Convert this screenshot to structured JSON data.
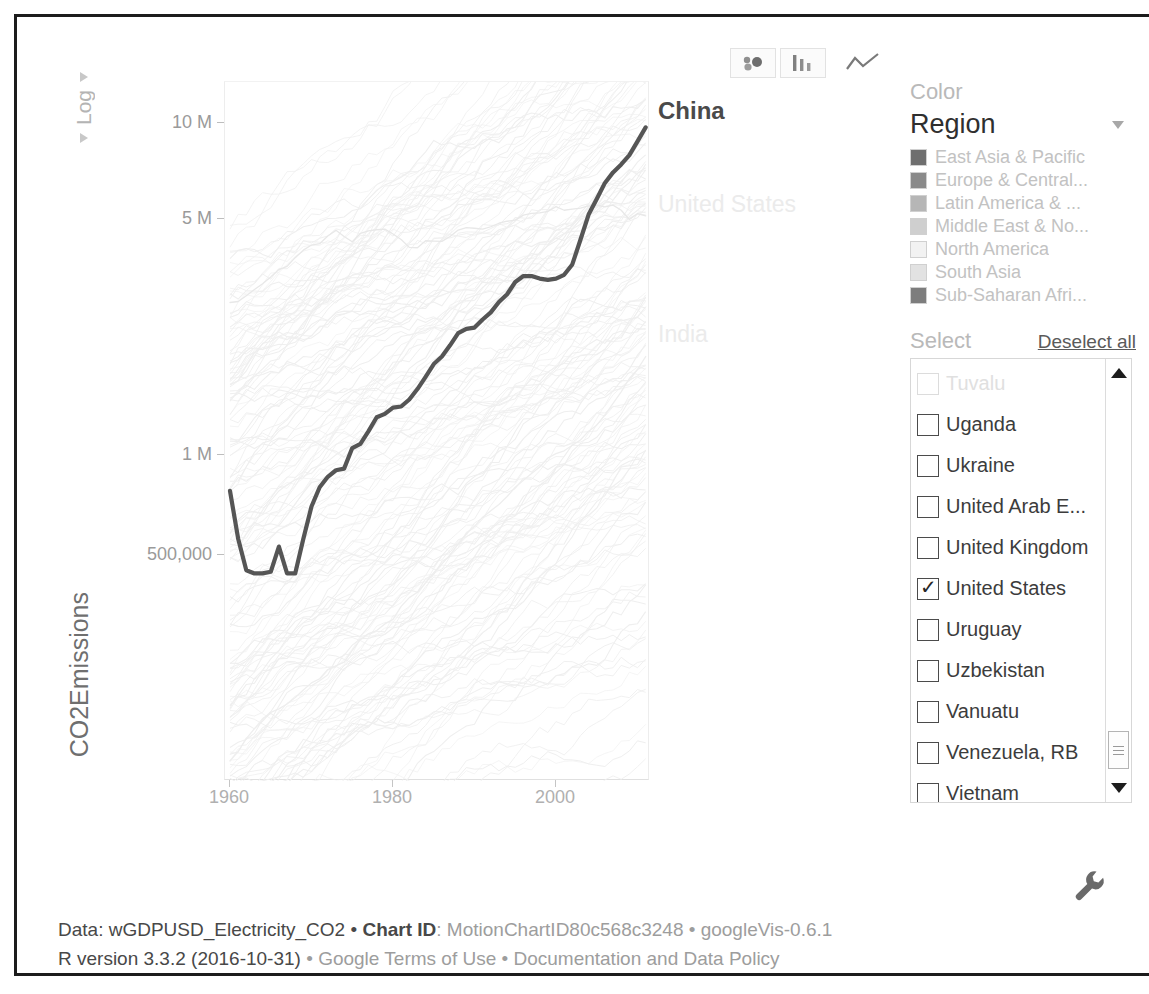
{
  "toolbar": {
    "buttons": [
      {
        "name": "bubble-chart",
        "label": "Bubbles",
        "active": false
      },
      {
        "name": "bar-chart",
        "label": "Bars",
        "active": false
      },
      {
        "name": "line-chart",
        "label": "Lines",
        "active": true
      }
    ]
  },
  "axis_controls": {
    "y_scale_label": "Log"
  },
  "color_panel": {
    "caption": "Color",
    "selected": "Region",
    "legend": [
      {
        "label": "East Asia & Pacific",
        "color": "#6f6f6f"
      },
      {
        "label": "Europe & Central...",
        "color": "#8a8a8a"
      },
      {
        "label": "Latin America & ...",
        "color": "#b6b6b6"
      },
      {
        "label": "Middle East & No...",
        "color": "#cfcfcf"
      },
      {
        "label": "North America",
        "color": "#f2f2f2"
      },
      {
        "label": "South Asia",
        "color": "#e2e2e2"
      },
      {
        "label": "Sub-Saharan Afri...",
        "color": "#7d7d7d"
      }
    ]
  },
  "select_panel": {
    "caption": "Select",
    "deselect_all": "Deselect all",
    "items": [
      {
        "label": "Tuvalu",
        "checked": false,
        "faded": true
      },
      {
        "label": "Uganda",
        "checked": false,
        "faded": false
      },
      {
        "label": "Ukraine",
        "checked": false,
        "faded": false
      },
      {
        "label": "United Arab E...",
        "checked": false,
        "faded": false
      },
      {
        "label": "United Kingdom",
        "checked": false,
        "faded": false
      },
      {
        "label": "United States",
        "checked": true,
        "faded": false
      },
      {
        "label": "Uruguay",
        "checked": false,
        "faded": false
      },
      {
        "label": "Uzbekistan",
        "checked": false,
        "faded": false
      },
      {
        "label": "Vanuatu",
        "checked": false,
        "faded": false
      },
      {
        "label": "Venezuela, RB",
        "checked": false,
        "faded": false
      },
      {
        "label": "Vietnam",
        "checked": false,
        "faded": false
      },
      {
        "label": "Virgin Islands (...",
        "checked": false,
        "faded": true
      },
      {
        "label": "West Bank and...",
        "checked": false,
        "faded": false
      }
    ],
    "checkmark": "✓"
  },
  "footer": {
    "line1_a": "Data: wGDPUSD_Electricity_CO2 • ",
    "line1_b": "Chart ID",
    "line1_c": ": MotionChartID80c568c3248 • googleVis-0.6.1",
    "line2_a": "R version 3.3.2 (2016-10-31)",
    "line2_b": " • Google Terms of Use • Documentation and Data Policy"
  },
  "icons": {
    "settings": "wrench-icon"
  },
  "chart_data": {
    "type": "line",
    "title": "",
    "xlabel": "",
    "ylabel": "CO2Emissions",
    "yscale": "log",
    "ylim": [
      300000,
      13000000
    ],
    "xlim": [
      1960,
      2011
    ],
    "grid": false,
    "legend_position": "right-inline",
    "ytick_labels": [
      "10 M",
      "5 M",
      "1 M",
      "500,000"
    ],
    "ytick_values": [
      10000000,
      5000000,
      1000000,
      500000
    ],
    "xtick_labels": [
      "1960",
      "1980",
      "2000"
    ],
    "xtick_values": [
      1960,
      1980,
      2000
    ],
    "series": [
      {
        "name": "China",
        "highlight": true,
        "color": "#555555",
        "x": [
          1960,
          1961,
          1962,
          1963,
          1964,
          1965,
          1966,
          1967,
          1968,
          1969,
          1970,
          1971,
          1972,
          1973,
          1974,
          1975,
          1976,
          1977,
          1978,
          1979,
          1980,
          1981,
          1982,
          1983,
          1984,
          1985,
          1986,
          1987,
          1988,
          1989,
          1990,
          1991,
          1992,
          1993,
          1994,
          1995,
          1996,
          1997,
          1998,
          1999,
          2000,
          2001,
          2002,
          2003,
          2004,
          2005,
          2006,
          2007,
          2008,
          2009,
          2010,
          2011
        ],
        "y": [
          780000,
          560000,
          450000,
          440000,
          440000,
          445000,
          530000,
          440000,
          440000,
          560000,
          700000,
          800000,
          860000,
          900000,
          910000,
          1050000,
          1080000,
          1180000,
          1300000,
          1330000,
          1390000,
          1400000,
          1470000,
          1580000,
          1720000,
          1880000,
          1980000,
          2140000,
          2330000,
          2400000,
          2420000,
          2560000,
          2690000,
          2890000,
          3050000,
          3320000,
          3460000,
          3460000,
          3400000,
          3370000,
          3400000,
          3490000,
          3750000,
          4450000,
          5300000,
          5900000,
          6600000,
          7100000,
          7500000,
          8000000,
          8800000,
          9700000
        ]
      },
      {
        "name": "United States",
        "highlight": false,
        "color": "#e8e8e8",
        "x": [
          1960,
          1961,
          1962,
          1963,
          1964,
          1965,
          1966,
          1967,
          1968,
          1969,
          1970,
          1971,
          1972,
          1973,
          1974,
          1975,
          1976,
          1977,
          1978,
          1979,
          1980,
          1981,
          1982,
          1983,
          1984,
          1985,
          1986,
          1987,
          1988,
          1989,
          1990,
          1991,
          1992,
          1993,
          1994,
          1995,
          1996,
          1997,
          1998,
          1999,
          2000,
          2001,
          2002,
          2003,
          2004,
          2005,
          2006,
          2007,
          2008,
          2009,
          2010,
          2011
        ],
        "y": [
          2880000,
          2900000,
          3020000,
          3150000,
          3280000,
          3440000,
          3620000,
          3700000,
          3930000,
          4140000,
          4290000,
          4330000,
          4570000,
          4750000,
          4550000,
          4390000,
          4650000,
          4730000,
          4770000,
          4790000,
          4630000,
          4460000,
          4220000,
          4210000,
          4420000,
          4410000,
          4400000,
          4550000,
          4760000,
          4840000,
          4820000,
          4790000,
          4870000,
          4990000,
          5060000,
          5100000,
          5280000,
          5340000,
          5360000,
          5420000,
          5600000,
          5460000,
          5500000,
          5540000,
          5630000,
          5660000,
          5590000,
          5660000,
          5460000,
          5120000,
          5330000,
          5250000
        ]
      },
      {
        "name": "India",
        "highlight": false,
        "color": "#eeeeee",
        "x": [
          1960,
          1961,
          1962,
          1963,
          1964,
          1965,
          1966,
          1967,
          1968,
          1969,
          1970,
          1971,
          1972,
          1973,
          1974,
          1975,
          1976,
          1977,
          1978,
          1979,
          1980,
          1981,
          1982,
          1983,
          1984,
          1985,
          1986,
          1987,
          1988,
          1989,
          1990,
          1991,
          1992,
          1993,
          1994,
          1995,
          1996,
          1997,
          1998,
          1999,
          2000,
          2001,
          2002,
          2003,
          2004,
          2005,
          2006,
          2007,
          2008,
          2009,
          2010,
          2011
        ],
        "y": [
          120000,
          128000,
          140000,
          150000,
          158000,
          168000,
          172000,
          178000,
          186000,
          196000,
          206000,
          212000,
          226000,
          232000,
          238000,
          258000,
          278000,
          290000,
          296000,
          310000,
          320000,
          350000,
          372000,
          386000,
          412000,
          442000,
          470000,
          500000,
          540000,
          580000,
          610000,
          650000,
          680000,
          710000,
          750000,
          800000,
          840000,
          880000,
          920000,
          980000,
          1010000,
          1030000,
          1070000,
          1110000,
          1180000,
          1230000,
          1320000,
          1430000,
          1550000,
          1700000,
          1810000,
          1980000
        ]
      }
    ],
    "background_series_note": "Approximately 180 additional faint country lines rendered in very light grey."
  }
}
